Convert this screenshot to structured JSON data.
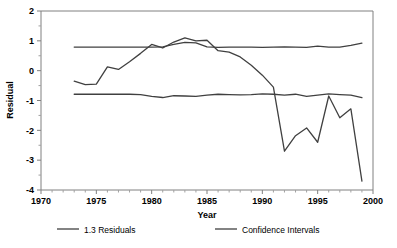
{
  "chart_data": {
    "type": "line",
    "title": "",
    "xlabel": "Year",
    "ylabel": "Residual",
    "xlim": [
      1970,
      2000
    ],
    "ylim": [
      -4,
      2
    ],
    "xticks": [
      1970,
      1975,
      1980,
      1985,
      1990,
      1995,
      2000
    ],
    "yticks": [
      2,
      1,
      0,
      -1,
      -2,
      -3,
      -4
    ],
    "xtick_labels": [
      "1970",
      "1975",
      "1980",
      "1985",
      "1990",
      "1995",
      "2000"
    ],
    "ytick_labels": [
      "2",
      "1",
      "0",
      "-1",
      "-2",
      "-3",
      "-4"
    ],
    "x_minor_tick_interval": 1,
    "y_minor_tick_interval": 0.5,
    "grid": false,
    "legend_position": "below",
    "x": [
      1973,
      1974,
      1975,
      1976,
      1977,
      1978,
      1979,
      1980,
      1981,
      1982,
      1983,
      1984,
      1985,
      1986,
      1987,
      1988,
      1989,
      1990,
      1991,
      1992,
      1993,
      1994,
      1995,
      1996,
      1997,
      1998,
      1999
    ],
    "series": [
      {
        "name": "1.3 Residuals",
        "color": "#404040",
        "values": [
          -0.35,
          -0.47,
          -0.45,
          0.13,
          0.04,
          0.3,
          0.58,
          0.88,
          0.76,
          0.96,
          1.1,
          1.0,
          1.02,
          0.67,
          0.62,
          0.46,
          0.18,
          -0.15,
          -0.55,
          -2.7,
          -2.18,
          -1.92,
          -2.4,
          -0.85,
          -1.58,
          -1.28,
          -3.7
        ]
      },
      {
        "name": "Confidence Intervals",
        "color": "#404040",
        "values_upper": [
          0.79,
          0.79,
          0.79,
          0.79,
          0.79,
          0.79,
          0.79,
          0.79,
          0.8,
          0.88,
          0.95,
          0.93,
          0.8,
          0.78,
          0.79,
          0.79,
          0.79,
          0.78,
          0.79,
          0.8,
          0.79,
          0.78,
          0.82,
          0.79,
          0.79,
          0.85,
          0.92
        ],
        "values_lower": [
          -0.79,
          -0.79,
          -0.79,
          -0.79,
          -0.79,
          -0.79,
          -0.8,
          -0.86,
          -0.9,
          -0.84,
          -0.85,
          -0.86,
          -0.82,
          -0.79,
          -0.8,
          -0.81,
          -0.8,
          -0.78,
          -0.79,
          -0.82,
          -0.79,
          -0.86,
          -0.82,
          -0.78,
          -0.8,
          -0.82,
          -0.9
        ]
      }
    ]
  },
  "axes": {
    "y_axis_title": "Residual",
    "x_axis_title": "Year"
  },
  "legend": {
    "items": [
      {
        "label": "1.3 Residuals",
        "color": "#404040"
      },
      {
        "label": "Confidence Intervals",
        "color": "#404040"
      }
    ]
  }
}
